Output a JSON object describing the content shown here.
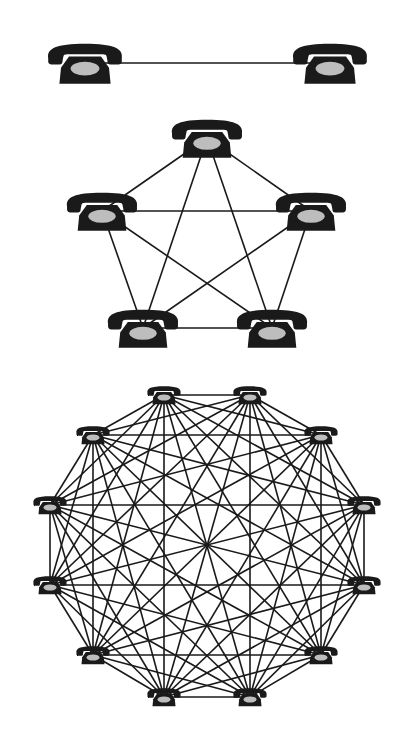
{
  "diagram": {
    "type": "complete-graph-network",
    "colors": {
      "background": "#ffffff",
      "phone_body": "#1a1a1a",
      "phone_dial": "#bdbdbd",
      "line": "#1a1a1a"
    },
    "icon": "telephone-icon",
    "networks": [
      {
        "name": "network-2",
        "node_count": 2,
        "edge_count": 1,
        "phone_size": [
          80,
          42
        ],
        "line_width": 1.4,
        "nodes": [
          [
            85,
            63
          ],
          [
            330,
            63
          ]
        ]
      },
      {
        "name": "network-5",
        "node_count": 5,
        "edge_count": 10,
        "phone_size": [
          76,
          40
        ],
        "line_width": 1.6,
        "nodes": [
          [
            207,
            138
          ],
          [
            311,
            211
          ],
          [
            272,
            328
          ],
          [
            143,
            328
          ],
          [
            102,
            211
          ]
        ]
      },
      {
        "name": "network-12",
        "node_count": 12,
        "edge_count": 66,
        "phone_size": [
          36,
          21
        ],
        "line_width": 1.6,
        "nodes": [
          [
            164,
            395
          ],
          [
            250,
            395
          ],
          [
            321,
            435
          ],
          [
            364,
            505
          ],
          [
            364,
            585
          ],
          [
            321,
            655
          ],
          [
            250,
            697
          ],
          [
            164,
            697
          ],
          [
            93,
            655
          ],
          [
            50,
            585
          ],
          [
            50,
            505
          ],
          [
            93,
            435
          ]
        ]
      }
    ]
  }
}
